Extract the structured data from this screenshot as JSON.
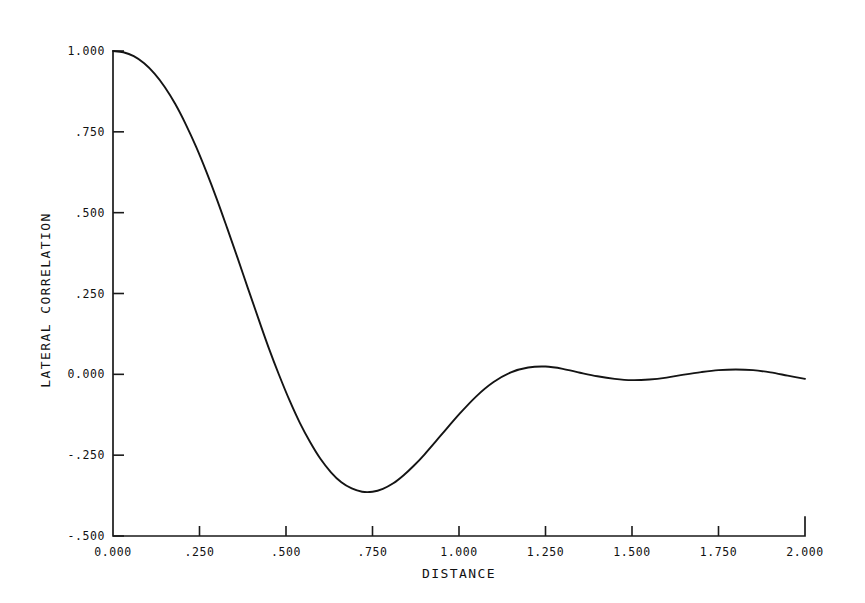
{
  "figure": {
    "background_color": "#ffffff",
    "ink_color": "#141414"
  },
  "chart_data": {
    "type": "line",
    "title": "",
    "subtitle": "",
    "xlabel": "DISTANCE",
    "ylabel": "LATERAL CORRELATION",
    "xlim": [
      0.0,
      2.0
    ],
    "ylim": [
      -0.5,
      1.0
    ],
    "grid": false,
    "legend": null,
    "legend_position": "none",
    "xticks": [
      0.0,
      0.25,
      0.5,
      0.75,
      1.0,
      1.25,
      1.5,
      1.75,
      2.0
    ],
    "xtick_labels": [
      "0.000",
      ".250",
      ".500",
      ".750",
      "1.000",
      "1.250",
      "1.500",
      "1.750",
      "2.000"
    ],
    "yticks": [
      1.0,
      0.75,
      0.5,
      0.25,
      0.0,
      -0.25,
      -0.5
    ],
    "ytick_labels": [
      "1.000",
      ".750",
      ".500",
      ".250",
      "0.000",
      "-.250",
      "-.500"
    ],
    "series": [
      {
        "name": "lateral correlation",
        "color": "#141414",
        "x": [
          0.0,
          0.03,
          0.06,
          0.09,
          0.12,
          0.15,
          0.18,
          0.21,
          0.24,
          0.27,
          0.3,
          0.33,
          0.36,
          0.39,
          0.42,
          0.45,
          0.48,
          0.51,
          0.54,
          0.57,
          0.6,
          0.63,
          0.66,
          0.69,
          0.72,
          0.75,
          0.78,
          0.81,
          0.84,
          0.87,
          0.9,
          0.95,
          1.0,
          1.05,
          1.1,
          1.15,
          1.2,
          1.25,
          1.3,
          1.35,
          1.4,
          1.45,
          1.5,
          1.55,
          1.6,
          1.65,
          1.7,
          1.75,
          1.8,
          1.85,
          1.9,
          1.95,
          2.0
        ],
        "y": [
          1.0,
          0.996,
          0.984,
          0.962,
          0.93,
          0.888,
          0.836,
          0.774,
          0.704,
          0.626,
          0.542,
          0.452,
          0.36,
          0.266,
          0.173,
          0.082,
          -0.002,
          -0.08,
          -0.15,
          -0.21,
          -0.262,
          -0.303,
          -0.334,
          -0.353,
          -0.363,
          -0.363,
          -0.354,
          -0.337,
          -0.312,
          -0.282,
          -0.248,
          -0.186,
          -0.124,
          -0.068,
          -0.024,
          0.006,
          0.021,
          0.024,
          0.017,
          0.005,
          -0.006,
          -0.014,
          -0.018,
          -0.016,
          -0.01,
          -0.001,
          0.007,
          0.013,
          0.015,
          0.013,
          0.006,
          -0.004,
          -0.014
        ],
        "annotations": [
          {
            "label": "start value",
            "x": 0.0,
            "y": 1.0
          },
          {
            "label": "first zero crossing",
            "x": 0.48,
            "y": 0.0
          },
          {
            "label": "global minimum",
            "x": 0.58,
            "y": -0.37
          },
          {
            "label": "second zero crossing",
            "x": 1.16,
            "y": 0.0
          },
          {
            "label": "first local maximum",
            "x": 1.24,
            "y": 0.025
          },
          {
            "label": "first ripple minimum",
            "x": 1.48,
            "y": -0.018
          },
          {
            "label": "second local maximum",
            "x": 1.8,
            "y": 0.016
          },
          {
            "label": "end value",
            "x": 2.0,
            "y": -0.014
          }
        ]
      }
    ]
  },
  "axes_geometry": {
    "x_pixel_min": 113,
    "x_pixel_max": 805,
    "y_pixel_top": 51,
    "y_pixel_bottom": 536
  }
}
